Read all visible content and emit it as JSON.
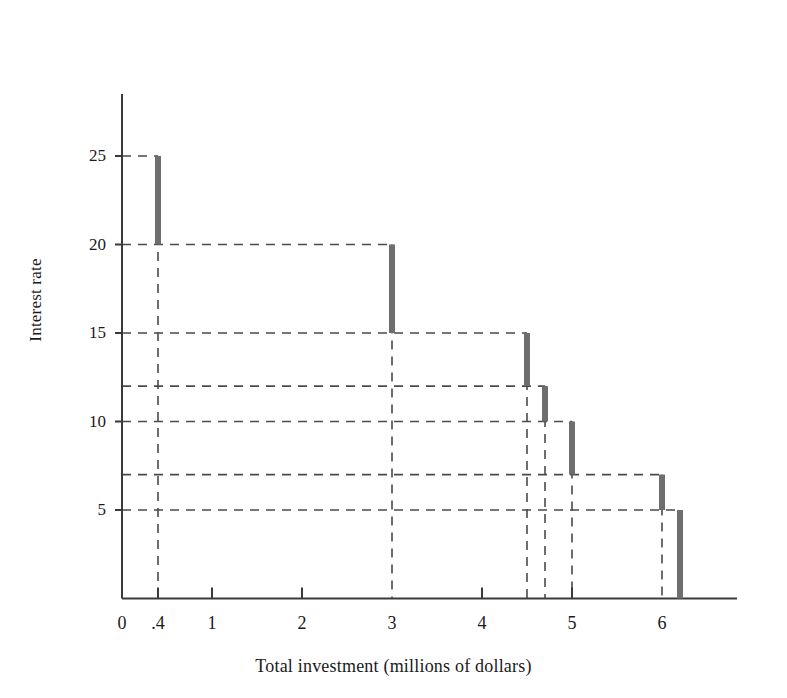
{
  "chart_data": {
    "type": "line",
    "title": "",
    "subtitle": "",
    "xlabel": "Total investment (millions of dollars)",
    "ylabel": "Interest rate",
    "xlim": [
      0,
      7.1
    ],
    "ylim": [
      0,
      28
    ],
    "grid": "dashed-guidelines",
    "legend": "none",
    "x_ticks": [
      {
        "value": 0,
        "label": "0"
      },
      {
        "value": 0.4,
        "label": ".4"
      },
      {
        "value": 1,
        "label": "1"
      },
      {
        "value": 2,
        "label": "2"
      },
      {
        "value": 3,
        "label": "3"
      },
      {
        "value": 4,
        "label": "4"
      },
      {
        "value": 5,
        "label": "5"
      },
      {
        "value": 6,
        "label": "6"
      }
    ],
    "y_ticks": [
      {
        "value": 5,
        "label": "5"
      },
      {
        "value": 10,
        "label": "10"
      },
      {
        "value": 15,
        "label": "15"
      },
      {
        "value": 20,
        "label": "20"
      },
      {
        "value": 25,
        "label": "25"
      }
    ],
    "guideline_levels": [
      5,
      7,
      10,
      12,
      15,
      20,
      25
    ],
    "guideline_x": [
      0.4,
      3,
      4.5,
      4.7,
      5,
      6,
      6.2
    ],
    "steps": [
      {
        "x_start": 0,
        "x_end": 0.4,
        "rate": 25
      },
      {
        "x_start": 0.4,
        "x_end": 3,
        "rate": 20
      },
      {
        "x_start": 3,
        "x_end": 4.5,
        "rate": 15
      },
      {
        "x_start": 4.5,
        "x_end": 4.7,
        "rate": 12
      },
      {
        "x_start": 4.7,
        "x_end": 5,
        "rate": 10
      },
      {
        "x_start": 5,
        "x_end": 6,
        "rate": 7
      },
      {
        "x_start": 6,
        "x_end": 6.2,
        "rate": 5
      }
    ],
    "risers": [
      {
        "x": 0.4,
        "rate_top": 25,
        "rate_bottom": 20
      },
      {
        "x": 3,
        "rate_top": 20,
        "rate_bottom": 15
      },
      {
        "x": 4.5,
        "rate_top": 15,
        "rate_bottom": 12
      },
      {
        "x": 4.7,
        "rate_top": 12,
        "rate_bottom": 10
      },
      {
        "x": 5,
        "rate_top": 10,
        "rate_bottom": 7
      },
      {
        "x": 6,
        "rate_top": 7,
        "rate_bottom": 5
      },
      {
        "x": 6.2,
        "rate_top": 5,
        "rate_bottom": 0
      }
    ],
    "series_color": "#6e6e6e",
    "axis_color": "#3a3a3a",
    "guideline_color": "#4a4a4a"
  },
  "axes": {
    "y_title": "Interest rate",
    "x_title": "Total investment (millions of dollars)"
  }
}
